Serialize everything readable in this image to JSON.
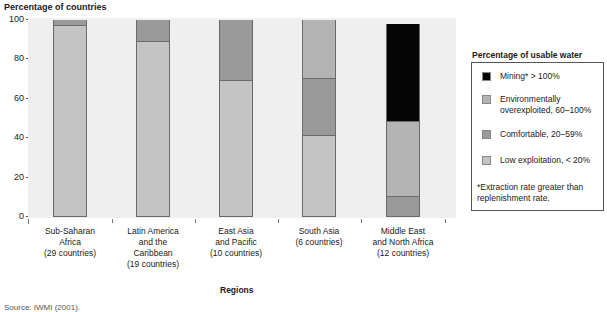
{
  "chart_data": {
    "type": "bar",
    "stacked": true,
    "title": "",
    "ylabel": "Percentage of countries",
    "xlabel": "Regions",
    "ylim": [
      0,
      100
    ],
    "yticks": [
      0,
      20,
      40,
      60,
      80,
      100
    ],
    "categories": [
      "Sub-Saharan Africa (29 countries)",
      "Latin America and the Caribbean (19 countries)",
      "East Asia and Pacific (10 countries)",
      "South Asia (6 countries)",
      "Middle East and North Africa (12 countries)"
    ],
    "series": [
      {
        "name": "Low exploitation, < 20%",
        "color": "#c4c4c4",
        "values": [
          97,
          89,
          69,
          41,
          0
        ]
      },
      {
        "name": "Comfortable, 20–59%",
        "color": "#9a9a9a",
        "values": [
          3,
          11,
          31,
          29,
          10
        ]
      },
      {
        "name": "Environmentally overexploited, 60–100%",
        "color": "#b4b4b4",
        "values": [
          0,
          0,
          0,
          30,
          38
        ]
      },
      {
        "name": "Mining* > 100%",
        "color": "#050505",
        "values": [
          0,
          0,
          0,
          0,
          50
        ]
      }
    ],
    "legend_title": "Percentage of usable water",
    "legend_position": "right",
    "grid": false,
    "annotations": [
      "*Extraction rate greater than replenishment rate."
    ]
  },
  "axis": {
    "y_title": "Percentage of countries",
    "x_title": "Regions",
    "y_ticks": [
      "100",
      "80",
      "60",
      "40",
      "20",
      "0"
    ]
  },
  "x_labels": [
    [
      "Sub-Saharan",
      "Africa",
      "(29 countries)"
    ],
    [
      "Latin America",
      "and the",
      "Caribbean",
      "(19 countries)"
    ],
    [
      "East Asia",
      "and Pacific",
      "(10 countries)"
    ],
    [
      "South Asia",
      "(6 countries)"
    ],
    [
      "Middle East",
      "and North Africa",
      "(12 countries)"
    ]
  ],
  "legend": {
    "title": "Percentage of usable water",
    "items": [
      {
        "label": "Mining* > 100%",
        "color": "#050505"
      },
      {
        "label": "Environmentally",
        "label2": "overexploited, 60–100%",
        "color": "#b4b4b4"
      },
      {
        "label": "Comfortable, 20–59%",
        "color": "#9a9a9a"
      },
      {
        "label": "Low exploitation, < 20%",
        "color": "#c4c4c4"
      }
    ],
    "note": "*Extraction rate greater than replenishment rate."
  },
  "source": "Source: IWMI (2001)."
}
